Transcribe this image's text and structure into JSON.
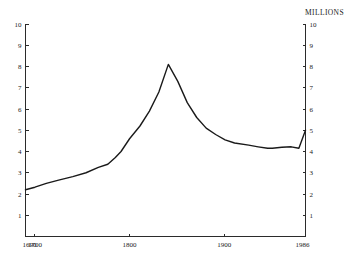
{
  "chart_data": {
    "type": "line",
    "title": "",
    "unit_label": "MILLIONS",
    "xlabel": "",
    "ylabel": "MILLIONS",
    "xlim": [
      1690,
      1986
    ],
    "ylim": [
      0,
      10
    ],
    "grid": false,
    "legend": null,
    "y_ticks": [
      10,
      9,
      8,
      7,
      6,
      5,
      4,
      3,
      2,
      1
    ],
    "y_tick_labels": [
      "10",
      "9",
      "8",
      "7",
      "6",
      "5",
      "4",
      "3",
      "2",
      "1"
    ],
    "y_axis_right_ticks": [
      10,
      9,
      8,
      7,
      6,
      5,
      4,
      3,
      2,
      1
    ],
    "y_axis_right_tick_labels": [
      "10",
      "9",
      "8",
      "7",
      "6",
      "5",
      "4",
      "3",
      "2",
      "1"
    ],
    "x_ticks": [
      1690,
      1700,
      1800,
      1900,
      1986
    ],
    "x_tick_labels": [
      "1690",
      "1700",
      "1800",
      "1900",
      "1986"
    ],
    "series": [
      {
        "name": "Population",
        "x": [
          1690,
          1700,
          1712,
          1725,
          1740,
          1754,
          1767,
          1777,
          1785,
          1791,
          1800,
          1811,
          1821,
          1831,
          1841,
          1851,
          1861,
          1871,
          1881,
          1891,
          1901,
          1911,
          1926,
          1936,
          1946,
          1951,
          1961,
          1971,
          1979,
          1986
        ],
        "y": [
          2.2,
          2.32,
          2.5,
          2.65,
          2.82,
          3.0,
          3.25,
          3.4,
          3.72,
          4.0,
          4.6,
          5.2,
          5.9,
          6.8,
          8.1,
          7.3,
          6.3,
          5.6,
          5.1,
          4.8,
          4.55,
          4.4,
          4.3,
          4.22,
          4.15,
          4.15,
          4.2,
          4.22,
          4.15,
          5.0
        ]
      }
    ]
  },
  "axes": {
    "unit_label": "MILLIONS"
  }
}
